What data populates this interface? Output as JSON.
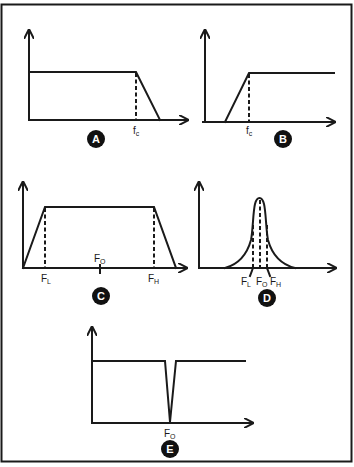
{
  "figure": {
    "colors": {
      "ink": "#1a1a1a",
      "background": "#ffffff",
      "badge": "#111111",
      "badge_text": "#ffffff"
    }
  },
  "panels": [
    {
      "id": "A",
      "badge": "A",
      "type": "low-pass",
      "labels": [
        {
          "main": "f",
          "sub": "c"
        }
      ]
    },
    {
      "id": "B",
      "badge": "B",
      "type": "high-pass",
      "labels": [
        {
          "main": "f",
          "sub": "c"
        }
      ]
    },
    {
      "id": "C",
      "badge": "C",
      "type": "wide band-pass",
      "labels": [
        {
          "main": "F",
          "sub": "L"
        },
        {
          "main": "F",
          "sub": "O"
        },
        {
          "main": "F",
          "sub": "H"
        }
      ]
    },
    {
      "id": "D",
      "badge": "D",
      "type": "narrow band-pass",
      "labels": [
        {
          "main": "F",
          "sub": "L"
        },
        {
          "main": "F",
          "sub": "O"
        },
        {
          "main": "F",
          "sub": "H"
        }
      ]
    },
    {
      "id": "E",
      "badge": "E",
      "type": "notch (band-reject)",
      "labels": [
        {
          "main": "F",
          "sub": "O"
        }
      ]
    }
  ]
}
